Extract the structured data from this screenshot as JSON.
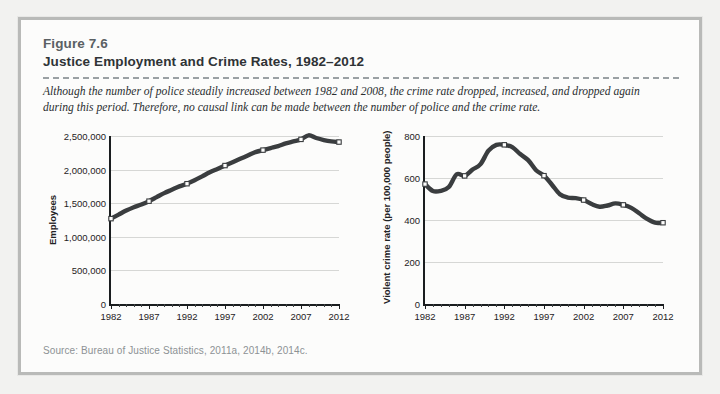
{
  "figure": {
    "number": "Figure 7.6",
    "title": "Justice Employment and Crime Rates, 1982–2012",
    "caption": "Although the number of police steadily increased between 1982 and 2008, the crime rate dropped, increased, and dropped again during this period. Therefore, no causal link can be made between the number of police and the crime rate.",
    "source": "Source: Bureau of Justice Statistics, 2011a, 2014b, 2014c.",
    "accent_color": "#3a3d3f",
    "gridline_color": "#d6d7d5",
    "frame_color": "#b9bab8",
    "background_color": "#fcfcfb"
  },
  "chart_data": [
    {
      "id": "employment",
      "type": "line",
      "title": "",
      "xlabel": "",
      "ylabel": "Employees",
      "xlim": [
        1982,
        2012
      ],
      "ylim": [
        0,
        2500000
      ],
      "grid": true,
      "legend": "none",
      "xticks": [
        1982,
        1987,
        1992,
        1997,
        2002,
        2007,
        2012
      ],
      "xtick_labels": [
        "1982",
        "1987",
        "1992",
        "1997",
        "2002",
        "2007",
        "2012"
      ],
      "minor_xtick_interval": 1,
      "yticks": [
        0,
        500000,
        1000000,
        1500000,
        2000000,
        2500000
      ],
      "ytick_labels": [
        "0",
        "500,000",
        "1,000,000",
        "1,500,000",
        "2,000,000",
        "2,500,000"
      ],
      "marker_years": [
        1982,
        1987,
        1992,
        1997,
        2002,
        2007,
        2012
      ],
      "x": [
        1982,
        1983,
        1984,
        1985,
        1986,
        1987,
        1988,
        1989,
        1990,
        1991,
        1992,
        1993,
        1994,
        1995,
        1996,
        1997,
        1998,
        1999,
        2000,
        2001,
        2002,
        2003,
        2004,
        2005,
        2006,
        2007,
        2008,
        2009,
        2010,
        2011,
        2012
      ],
      "values": [
        1270000,
        1330000,
        1390000,
        1440000,
        1480000,
        1530000,
        1590000,
        1650000,
        1700000,
        1750000,
        1790000,
        1840000,
        1900000,
        1960000,
        2010000,
        2060000,
        2110000,
        2160000,
        2210000,
        2260000,
        2290000,
        2320000,
        2350000,
        2390000,
        2420000,
        2450000,
        2510000,
        2470000,
        2440000,
        2420000,
        2410000
      ]
    },
    {
      "id": "crime",
      "type": "line",
      "title": "",
      "xlabel": "",
      "ylabel": "Violent crime rate (per 100,000 people)",
      "xlim": [
        1982,
        2012
      ],
      "ylim": [
        0,
        800
      ],
      "grid": true,
      "legend": "none",
      "xticks": [
        1982,
        1987,
        1992,
        1997,
        2002,
        2007,
        2012
      ],
      "xtick_labels": [
        "1982",
        "1987",
        "1992",
        "1997",
        "2002",
        "2007",
        "2012"
      ],
      "minor_xtick_interval": 1,
      "yticks": [
        0,
        200,
        400,
        600,
        800
      ],
      "ytick_labels": [
        "0",
        "200",
        "400",
        "600",
        "800"
      ],
      "marker_years": [
        1982,
        1987,
        1992,
        1997,
        2002,
        2007,
        2012
      ],
      "x": [
        1982,
        1983,
        1984,
        1985,
        1986,
        1987,
        1988,
        1989,
        1990,
        1991,
        1992,
        1993,
        1994,
        1995,
        1996,
        1997,
        1998,
        1999,
        2000,
        2001,
        2002,
        2003,
        2004,
        2005,
        2006,
        2007,
        2008,
        2009,
        2010,
        2011,
        2012
      ],
      "values": [
        571,
        538,
        539,
        557,
        618,
        610,
        640,
        666,
        730,
        758,
        758,
        747,
        714,
        685,
        637,
        611,
        568,
        523,
        507,
        504,
        495,
        476,
        463,
        469,
        479,
        472,
        458,
        432,
        405,
        387,
        387
      ]
    }
  ]
}
